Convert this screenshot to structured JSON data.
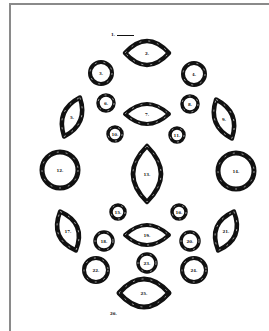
{
  "diagram": {
    "title_marker": {
      "label": "1."
    },
    "shapes": [
      {
        "id": 2,
        "label": "2.",
        "kind": "horizontal-oval"
      },
      {
        "id": 3,
        "label": "3.",
        "kind": "ring"
      },
      {
        "id": 4,
        "label": "4.",
        "kind": "ring"
      },
      {
        "id": 5,
        "label": "5.",
        "kind": "tilted-oval-left"
      },
      {
        "id": 6,
        "label": "6.",
        "kind": "small-ring"
      },
      {
        "id": 7,
        "label": "7.",
        "kind": "horizontal-oval"
      },
      {
        "id": 8,
        "label": "8.",
        "kind": "small-ring"
      },
      {
        "id": 9,
        "label": "9.",
        "kind": "tilted-oval-right"
      },
      {
        "id": 10,
        "label": "10.",
        "kind": "small-ring"
      },
      {
        "id": 11,
        "label": "11.",
        "kind": "small-ring"
      },
      {
        "id": 12,
        "label": "12.",
        "kind": "large-ring"
      },
      {
        "id": 13,
        "label": "13.",
        "kind": "vertical-oval"
      },
      {
        "id": 14,
        "label": "14.",
        "kind": "large-ring"
      },
      {
        "id": 15,
        "label": "15.",
        "kind": "small-ring"
      },
      {
        "id": 16,
        "label": "16.",
        "kind": "small-ring"
      },
      {
        "id": 17,
        "label": "17.",
        "kind": "tilted-oval-right"
      },
      {
        "id": 18,
        "label": "18.",
        "kind": "small-ring"
      },
      {
        "id": 19,
        "label": "19.",
        "kind": "horizontal-oval"
      },
      {
        "id": 20,
        "label": "20.",
        "kind": "small-ring"
      },
      {
        "id": 21,
        "label": "21.",
        "kind": "tilted-oval-left"
      },
      {
        "id": 22,
        "label": "22.",
        "kind": "ring"
      },
      {
        "id": 23,
        "label": "23.",
        "kind": "small-ring"
      },
      {
        "id": 24,
        "label": "24.",
        "kind": "ring"
      },
      {
        "id": 25,
        "label": "25.",
        "kind": "horizontal-oval"
      }
    ],
    "footer_label": "26.",
    "colors": {
      "ink": "#111111",
      "frame": "#8a8a8a",
      "paper": "#ffffff"
    }
  }
}
